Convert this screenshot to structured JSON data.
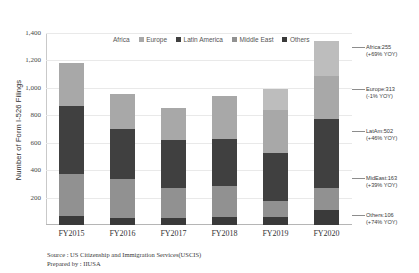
{
  "chart_data": {
    "type": "bar",
    "stacked": true,
    "title": "",
    "xlabel": "",
    "ylabel": "Number of Form I-526 Filings",
    "ylim": [
      0,
      1400
    ],
    "yticks": [
      "200",
      "400",
      "600",
      "800",
      "1,000",
      "1,200",
      "1,400"
    ],
    "ytick_values": [
      200,
      400,
      600,
      800,
      1000,
      1200,
      1400
    ],
    "grid": true,
    "legend_position": "top-center",
    "categories": [
      "FY2015",
      "FY2016",
      "FY2017",
      "FY2018",
      "FY2019",
      "FY2020"
    ],
    "series": [
      {
        "name": "Others",
        "color": "#3a3a3a",
        "values": [
          64,
          48,
          52,
          55,
          61,
          106
        ]
      },
      {
        "name": "Middle East",
        "color": "#919191",
        "values": [
          305,
          290,
          215,
          230,
          117,
          163
        ]
      },
      {
        "name": "Latin America",
        "color": "#404040",
        "values": [
          500,
          365,
          355,
          340,
          344,
          502
        ]
      },
      {
        "name": "Europe",
        "color": "#a8a8a8",
        "values": [
          311,
          249,
          235,
          315,
          316,
          313
        ]
      },
      {
        "name": "Africa",
        "color": "#bdbdbd",
        "values": [
          0,
          0,
          0,
          0,
          151,
          255
        ]
      }
    ],
    "totals": [
      1180,
      952,
      857,
      940,
      989,
      1085
    ],
    "annotations": [
      {
        "name": "Africa",
        "value": "255",
        "yoy": "+69% YOY",
        "label": "Africa:255",
        "yoy_label": "(+69% YOY)"
      },
      {
        "name": "Europe",
        "value": "313",
        "yoy": "-1% YOY",
        "label": "Europe:313",
        "yoy_label": "(-1% YOY)"
      },
      {
        "name": "LatAm",
        "value": "502",
        "yoy": "+46% YOY",
        "label": "LatAm:502",
        "yoy_label": "(+46% YOY)"
      },
      {
        "name": "MidEast",
        "value": "163",
        "yoy": "+39% YOY",
        "label": "MidEast:163",
        "yoy_label": "(+39% YOY)"
      },
      {
        "name": "Others",
        "value": "106",
        "yoy": "+74% YOY",
        "label": "Others:106",
        "yoy_label": "(+74% YOY)"
      }
    ]
  },
  "legend": {
    "items": [
      {
        "label": "Africa",
        "color": "#bdbdbd"
      },
      {
        "label": "Europe",
        "color": "#a8a8a8"
      },
      {
        "label": "Latin America",
        "color": "#404040"
      },
      {
        "label": "Middle East",
        "color": "#919191"
      },
      {
        "label": "Others",
        "color": "#3a3a3a"
      }
    ]
  },
  "axis": {
    "y_title": "Number of Form I-526 Filings"
  },
  "footer": {
    "source_line": "Source : US Citizenship and Immigration Services(USCIS)",
    "prepared_line": "Prepared by : IIUSA"
  }
}
